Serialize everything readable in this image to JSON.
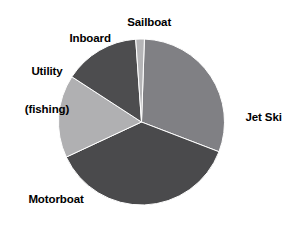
{
  "chart_data": {
    "type": "pie",
    "title": "",
    "subtitle": "",
    "xlabel": "",
    "ylabel": "",
    "legend_position": "none",
    "grid": false,
    "labels_outside": true,
    "categories": [
      "Jet Ski",
      "Motorboat",
      "Utility (fishing)",
      "Inboard",
      "Sailboat"
    ],
    "values": [
      39,
      33,
      16,
      10,
      2
    ],
    "slices": [
      {
        "label": "Jet Ski",
        "label_line_1": "Jet Ski",
        "value": 39,
        "percent": 39,
        "color": "#808084",
        "start_angle": 2,
        "end_angle": 111
      },
      {
        "label": "Motorboat",
        "label_line_1": "Motorboat",
        "value": 33,
        "percent": 33,
        "color": "#4a4a4c",
        "start_angle": 111,
        "end_angle": 245
      },
      {
        "label": "Utility (fishing)",
        "label_line_1": "Utility",
        "label_line_2": "(fishing)",
        "value": 16,
        "percent": 16,
        "color": "#b0b0b2",
        "start_angle": 245,
        "end_angle": 303
      },
      {
        "label": "Inboard",
        "label_line_1": "Inboard",
        "value": 10,
        "percent": 10,
        "color": "#4d4d4f",
        "start_angle": 303,
        "end_angle": 356
      },
      {
        "label": "Sailboat",
        "label_line_1": "Sailboat",
        "value": 2,
        "percent": 2,
        "color": "#b5b5b7",
        "start_angle": 356,
        "end_angle": 362
      }
    ],
    "geometry": {
      "center_x": 141.5,
      "center_y": 122,
      "radius": 83
    },
    "background_color": "#ffffff",
    "label_color": "#000000"
  }
}
